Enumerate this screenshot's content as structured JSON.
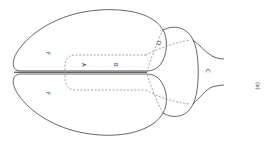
{
  "diagram": {
    "labels": {
      "F_upper": "F",
      "F_lower": "F",
      "A": "A",
      "B": "B",
      "C": "C",
      "D": "D",
      "panel": "(e)"
    },
    "colors": {
      "stroke": "#555555",
      "dashed": "#8a8a8a",
      "text": "#333333"
    }
  }
}
